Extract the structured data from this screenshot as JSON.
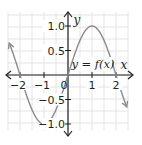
{
  "chart_data": {
    "type": "line",
    "title": "",
    "function_label": "y = f(x)",
    "xlabel": "x",
    "ylabel": "y",
    "origin_label": "0",
    "xlim": [
      -2.5,
      2.5
    ],
    "ylim": [
      -1.25,
      1.25
    ],
    "grid": true,
    "x_ticks": [
      -2,
      -1,
      1,
      2
    ],
    "x_tick_labels": [
      "−2",
      "−1",
      "1",
      "2"
    ],
    "y_ticks": [
      1.0,
      0.5,
      -0.5,
      -1.0
    ],
    "y_tick_labels": [
      "1.0",
      "0.5",
      "−0.5",
      "−1.0"
    ],
    "series": [
      {
        "name": "y = f(x)",
        "x": [
          -2.5,
          -2,
          -1.5,
          -1,
          -0.5,
          0,
          0.5,
          1,
          1.5,
          2,
          2.5
        ],
        "y": [
          0.71,
          0,
          -0.71,
          -1,
          -0.71,
          0,
          0.71,
          1,
          0.71,
          0,
          -0.71
        ],
        "arrows_at_ends": true
      }
    ],
    "colors": {
      "curve": "#8a8a8a",
      "axes": "#231f20",
      "grid": "#e3e3e3"
    }
  }
}
